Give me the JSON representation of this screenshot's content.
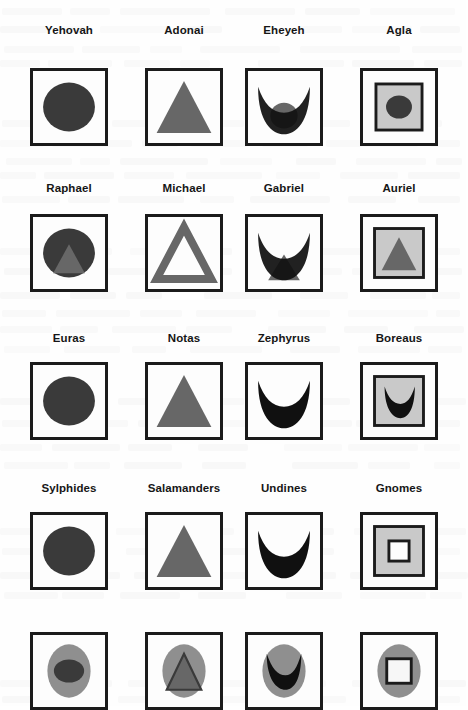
{
  "page": {
    "background_color": "#fefefe",
    "ink_color": "#1b1b1b",
    "dark_fill": "#3a3a3a",
    "gray_fill": "#676767",
    "light_gray_fill": "#c9c9c9",
    "medium_gray_fill": "#8f8f8f",
    "white_fill": "#f7f7f7",
    "columns": 4,
    "rows": 5
  },
  "grid": {
    "column_x": [
      30,
      145,
      245,
      360
    ],
    "box_size": 78,
    "row_label_y": [
      24,
      182,
      332,
      482,
      0
    ],
    "row_box_y": [
      68,
      214,
      362,
      512,
      632
    ]
  },
  "rows": [
    {
      "row_index": 1,
      "cells": [
        {
          "label": "Yehovah",
          "symbol": "filled-circle",
          "frame": "square"
        },
        {
          "label": "Adonai",
          "symbol": "filled-triangle",
          "frame": "square"
        },
        {
          "label": "Eheyeh",
          "symbol": "crescent-over-circle",
          "frame": "square"
        },
        {
          "label": "Agla",
          "symbol": "circle-in-square",
          "frame": "square"
        }
      ]
    },
    {
      "row_index": 2,
      "cells": [
        {
          "label": "Raphael",
          "symbol": "triangle-in-circle",
          "frame": "square"
        },
        {
          "label": "Michael",
          "symbol": "hollow-triangle",
          "frame": "square"
        },
        {
          "label": "Gabriel",
          "symbol": "crescent-over-triangle",
          "frame": "square"
        },
        {
          "label": "Auriel",
          "symbol": "triangle-in-square",
          "frame": "square"
        }
      ]
    },
    {
      "row_index": 3,
      "cells": [
        {
          "label": "Euras",
          "symbol": "filled-circle",
          "frame": "square"
        },
        {
          "label": "Notas",
          "symbol": "filled-triangle",
          "frame": "square"
        },
        {
          "label": "Zephyrus",
          "symbol": "crescent",
          "frame": "square"
        },
        {
          "label": "Boreaus",
          "symbol": "crescent-in-square",
          "frame": "square"
        }
      ]
    },
    {
      "row_index": 4,
      "cells": [
        {
          "label": "Sylphides",
          "symbol": "filled-circle",
          "frame": "square"
        },
        {
          "label": "Salamanders",
          "symbol": "filled-triangle",
          "frame": "square"
        },
        {
          "label": "Undines",
          "symbol": "crescent",
          "frame": "square"
        },
        {
          "label": "Gnomes",
          "symbol": "square-in-square",
          "frame": "square"
        }
      ]
    },
    {
      "row_index": 5,
      "cells": [
        {
          "label": "",
          "symbol": "circle-in-ellipse",
          "frame": "square"
        },
        {
          "label": "",
          "symbol": "triangle-in-ellipse",
          "frame": "square"
        },
        {
          "label": "",
          "symbol": "crescent-in-ellipse",
          "frame": "square"
        },
        {
          "label": "",
          "symbol": "square-in-ellipse",
          "frame": "square"
        }
      ]
    }
  ]
}
